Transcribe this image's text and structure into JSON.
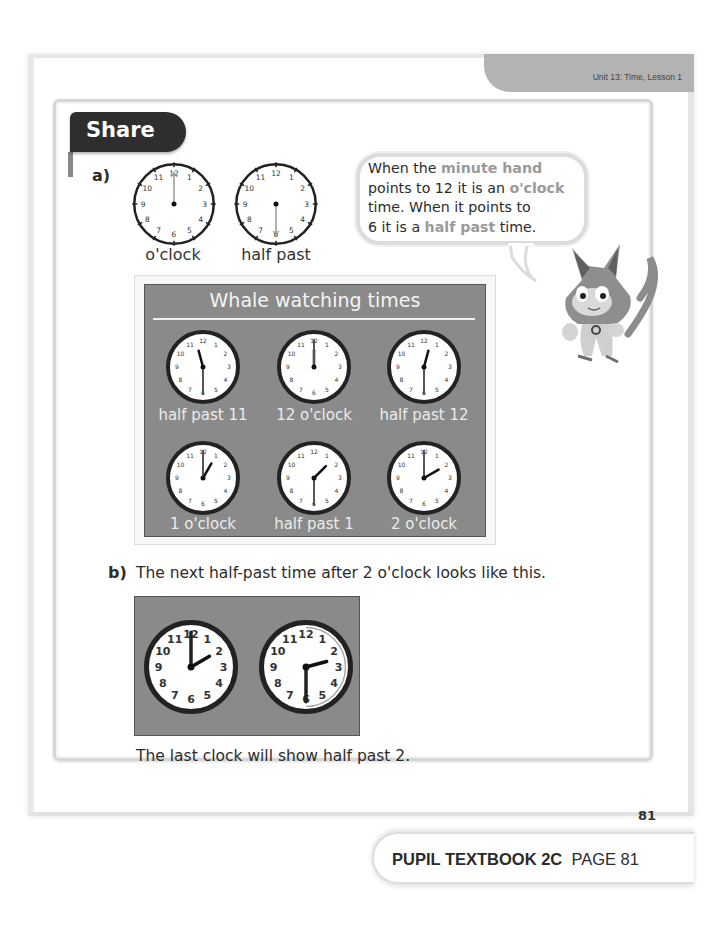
{
  "header": {
    "unit_label": "Unit 13: Time, Lesson 1"
  },
  "section": {
    "label": "Share"
  },
  "part_a": {
    "label": "a)",
    "example_clocks": [
      {
        "caption": "o'clock",
        "hour": 12,
        "minute": 0
      },
      {
        "caption": "half past",
        "hour": 12,
        "minute": 30
      }
    ],
    "speech": {
      "segments": [
        {
          "text": "When the ",
          "highlight": false
        },
        {
          "text": "minute hand",
          "highlight": true
        },
        {
          "text": " points to 12 it is an ",
          "highlight": false
        },
        {
          "text": "o'clock",
          "highlight": true
        },
        {
          "text": " time. When it points to 6 it is a ",
          "highlight": false
        },
        {
          "text": "half past",
          "highlight": true
        },
        {
          "text": " time.",
          "highlight": false
        }
      ],
      "line1a": "When the ",
      "line1b": "minute hand",
      "line2a": "points to 12 it is an ",
      "line2b": "o'clock",
      "line3": "time. When it points to",
      "line4a": "6 it is a ",
      "line4b": "half past",
      "line4c": " time."
    },
    "character": "cat-mascot",
    "whale_board": {
      "title": "Whale watching times",
      "clocks": [
        {
          "caption": "half past 11",
          "hour": 11,
          "minute": 30
        },
        {
          "caption": "12 o'clock",
          "hour": 12,
          "minute": 0
        },
        {
          "caption": "half past 12",
          "hour": 12,
          "minute": 30
        },
        {
          "caption": "1 o'clock",
          "hour": 1,
          "minute": 0
        },
        {
          "caption": "half past 1",
          "hour": 1,
          "minute": 30
        },
        {
          "caption": "2 o'clock",
          "hour": 2,
          "minute": 0
        }
      ]
    }
  },
  "part_b": {
    "label": "b)",
    "prompt": "The next half-past time after 2 o'clock looks like this.",
    "clocks": [
      {
        "hour": 2,
        "minute": 0,
        "shows_arc": false
      },
      {
        "hour": 2,
        "minute": 30,
        "shows_arc": true
      }
    ],
    "conclusion": "The last clock will show half past 2."
  },
  "page_number": "81",
  "footer": {
    "book": "PUPIL TEXTBOOK 2C",
    "page": "PAGE 81"
  },
  "colors": {
    "panel_gray": "#8a8a8a",
    "highlight_text": "#9a9a9a",
    "share_tab": "#2e2e2e",
    "unit_tab": "#b3b3b3"
  }
}
